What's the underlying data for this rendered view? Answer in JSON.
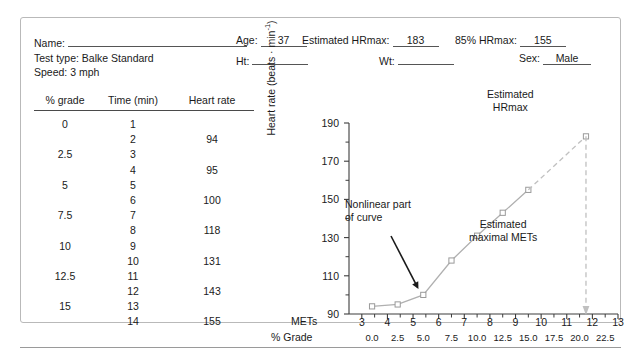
{
  "form": {
    "name_label": "Name:",
    "name_value": "",
    "testtype_label": "Test type: Balke Standard",
    "speed_label": "Speed: 3 mph",
    "age_label": "Age:",
    "age_value": "37",
    "ht_label": "Ht:",
    "ht_value": "",
    "wt_label": "Wt:",
    "wt_value": "",
    "est_hrmax_label": "Estimated HRmax:",
    "est_hrmax_value": "183",
    "hrmax85_label": "85% HRmax:",
    "hrmax85_value": "155",
    "sex_label": "Sex:",
    "sex_value": "Male"
  },
  "table": {
    "headers": [
      "% grade",
      "Time (min)",
      "Heart rate"
    ],
    "rows": [
      [
        "0",
        "1",
        ""
      ],
      [
        "",
        "2",
        "94"
      ],
      [
        "2.5",
        "3",
        ""
      ],
      [
        "",
        "4",
        "95"
      ],
      [
        "5",
        "5",
        ""
      ],
      [
        "",
        "6",
        "100"
      ],
      [
        "7.5",
        "7",
        ""
      ],
      [
        "",
        "8",
        "118"
      ],
      [
        "10",
        "9",
        ""
      ],
      [
        "",
        "10",
        "131"
      ],
      [
        "12.5",
        "11",
        ""
      ],
      [
        "",
        "12",
        "143"
      ],
      [
        "15",
        "13",
        ""
      ],
      [
        "",
        "14",
        "155"
      ]
    ]
  },
  "chart_data": {
    "type": "line",
    "title": "",
    "xlabel": "METs",
    "xlabel_secondary": "% Grade",
    "ylabel": "Heart rate (beats · min",
    "ylabel_sup": "-1",
    "ylabel_close": ")",
    "xlim": [
      2.5,
      13
    ],
    "ylim": [
      90,
      190
    ],
    "grid": false,
    "x_ticks": [
      3,
      4,
      5,
      6,
      7,
      8,
      9,
      10,
      11,
      12,
      13
    ],
    "x_tick_labels": [
      "3",
      "4",
      "5",
      "6",
      "7",
      "8",
      "9",
      "10",
      "11",
      "12",
      "13"
    ],
    "grade_ticks": [
      3.4,
      4.4,
      5.4,
      6.5,
      7.5,
      8.5,
      9.5,
      10.5,
      11.5,
      12.5
    ],
    "grade_tick_labels": [
      "0.0",
      "2.5",
      "5.0",
      "7.5",
      "10.0",
      "12.5",
      "15.0",
      "17.5",
      "20.0",
      "22.5"
    ],
    "y_ticks": [
      90,
      110,
      130,
      150,
      170,
      190
    ],
    "y_tick_labels": [
      "90",
      "110",
      "130",
      "150",
      "170",
      "190"
    ],
    "y_minor_ticks": [
      100,
      120,
      140,
      160,
      180
    ],
    "series": [
      {
        "name": "Measured heart rate",
        "color": "#b0b0b0",
        "marker": "square-open",
        "x": [
          3.4,
          4.4,
          5.4,
          6.5,
          7.5,
          8.5,
          9.5
        ],
        "y": [
          94,
          95,
          100,
          118,
          131,
          143,
          155
        ]
      },
      {
        "name": "Extrapolation to estimated HRmax",
        "color": "#c0c0c0",
        "style": "dashed",
        "x": [
          9.5,
          11.75
        ],
        "y": [
          155,
          183
        ]
      }
    ],
    "markers_extra": [
      {
        "name": "estimated-hrmax-point",
        "x": 11.75,
        "y": 183
      }
    ],
    "dropline": {
      "name": "estimated-maximal-mets-dropline",
      "x": 11.75,
      "y_from": 183,
      "y_to": 90,
      "style": "dashed",
      "arrow": "down",
      "color": "#c0c0c0"
    },
    "annotations": [
      {
        "name": "nonlinear-part-annotation",
        "text_line1": "Nonlinear part",
        "text_line2": "of curve",
        "arrow_to_x": 5.4,
        "arrow_to_y": 100
      },
      {
        "name": "estimated-maximal-mets-annotation",
        "text_line1": "Estimated",
        "text_line2": "maximal METs"
      },
      {
        "name": "estimated-hrmax-annotation",
        "text_line1": "Estimated",
        "text_line2": "HRmax"
      }
    ]
  }
}
